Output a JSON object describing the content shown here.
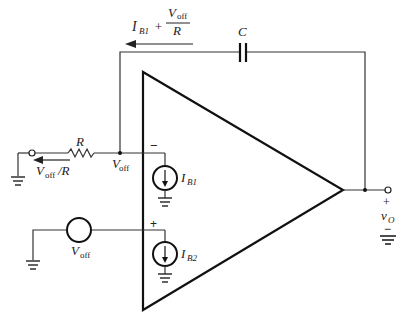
{
  "diagram": {
    "type": "circuit",
    "labels": {
      "feedback_current_main": "I",
      "feedback_current_sub": "B1",
      "plus": "+",
      "frac_num_main": "V",
      "frac_num_sub": "off",
      "frac_den": "R",
      "capacitor": "C",
      "resistor": "R",
      "node_voltage_main": "V",
      "node_voltage_sub": "off",
      "input_current_main": "V",
      "input_current_sub": "off",
      "input_current_tail": "/R",
      "ib1_main": "I",
      "ib1_sub": "B1",
      "ib2_main": "I",
      "ib2_sub": "B2",
      "voff_source_main": "V",
      "voff_source_sub": "off",
      "inverting_sign": "−",
      "noninverting_sign": "+",
      "output_plus": "+",
      "output_main": "v",
      "output_sub": "O",
      "output_minus": "−"
    },
    "components": [
      {
        "id": "R",
        "kind": "resistor"
      },
      {
        "id": "C",
        "kind": "capacitor"
      },
      {
        "id": "IB1",
        "kind": "current-source"
      },
      {
        "id": "IB2",
        "kind": "current-source"
      },
      {
        "id": "Voff",
        "kind": "voltage-source"
      },
      {
        "id": "opamp",
        "kind": "op-amp"
      }
    ]
  }
}
